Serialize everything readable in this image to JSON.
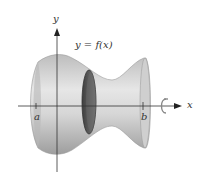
{
  "figure": {
    "type": "solid of revolution",
    "curve_label": "y = f(x)",
    "axes": {
      "x_label": "x",
      "y_label": "y"
    },
    "bounds": {
      "a_label": "a",
      "b_label": "b"
    },
    "rotation_icon": "rotation-arrow-icon",
    "colors": {
      "solid": "#c8c8c8",
      "solid_shadow": "#9a9a9a",
      "disk": "#555555",
      "axis": "#333333"
    }
  }
}
